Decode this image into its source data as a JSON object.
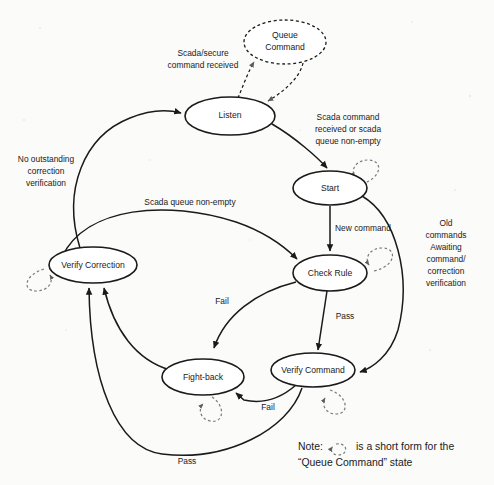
{
  "diagram": {
    "states": [
      {
        "id": "queue-command",
        "label_line1": "Queue",
        "label_line2": "Command",
        "cx": 285,
        "cy": 42,
        "rx": 41,
        "ry": 22,
        "style": "dashed"
      },
      {
        "id": "listen",
        "label_line1": "Listen",
        "label_line2": "",
        "cx": 230,
        "cy": 116,
        "rx": 45,
        "ry": 19,
        "style": "solid"
      },
      {
        "id": "start",
        "label_line1": "Start",
        "label_line2": "",
        "cx": 330,
        "cy": 188,
        "rx": 37,
        "ry": 17,
        "style": "solid"
      },
      {
        "id": "verify-correction",
        "label_line1": "Verify Correction",
        "label_line2": "",
        "cx": 93,
        "cy": 265,
        "rx": 44,
        "ry": 18,
        "style": "solid"
      },
      {
        "id": "check-rule",
        "label_line1": "Check Rule",
        "label_line2": "",
        "cx": 330,
        "cy": 273,
        "rx": 37,
        "ry": 18,
        "style": "solid"
      },
      {
        "id": "fight-back",
        "label_line1": "Fight-back",
        "label_line2": "",
        "cx": 203,
        "cy": 377,
        "rx": 41,
        "ry": 18,
        "style": "solid"
      },
      {
        "id": "verify-command",
        "label_line1": "Verify Command",
        "label_line2": "",
        "cx": 313,
        "cy": 370,
        "rx": 42,
        "ry": 17,
        "style": "solid"
      }
    ],
    "transitions": [
      {
        "id": "listen-to-queue",
        "from": "listen",
        "to": "queue-command",
        "style": "dashed"
      },
      {
        "id": "queue-to-listen",
        "from": "queue-command",
        "to": "listen",
        "style": "dashed"
      },
      {
        "id": "listen-to-start",
        "from": "listen",
        "to": "start",
        "style": "solid"
      },
      {
        "id": "verify-correction-to-listen",
        "from": "verify-correction",
        "to": "listen",
        "style": "solid"
      },
      {
        "id": "start-to-check-rule",
        "from": "start",
        "to": "check-rule",
        "style": "solid"
      },
      {
        "id": "verify-correction-to-check-rule",
        "from": "verify-correction",
        "to": "check-rule",
        "style": "solid"
      },
      {
        "id": "verify-command-to-start-loop",
        "from": "start",
        "to": "verify-command",
        "style": "solid"
      },
      {
        "id": "check-rule-to-fight-back",
        "from": "check-rule",
        "to": "fight-back",
        "style": "solid"
      },
      {
        "id": "check-rule-to-verify-command",
        "from": "check-rule",
        "to": "verify-command",
        "style": "solid"
      },
      {
        "id": "verify-command-to-fight-back",
        "from": "verify-command",
        "to": "fight-back",
        "style": "solid"
      },
      {
        "id": "fight-back-to-verify-correction",
        "from": "fight-back",
        "to": "verify-correction",
        "style": "solid"
      },
      {
        "id": "verify-command-to-verify-correction",
        "from": "verify-command",
        "to": "verify-correction",
        "style": "solid"
      }
    ],
    "self_loops": [
      {
        "id": "start-self-loop",
        "state": "start"
      },
      {
        "id": "check-rule-self-loop",
        "state": "check-rule"
      },
      {
        "id": "verify-correction-self-loop",
        "state": "verify-correction"
      },
      {
        "id": "fight-back-self-loop",
        "state": "fight-back"
      },
      {
        "id": "verify-command-self-loop",
        "state": "verify-command"
      }
    ],
    "edge_labels": [
      {
        "id": "label-scada-secure",
        "lines": [
          "Scada/secure",
          "command received"
        ],
        "x": 203,
        "y": 60
      },
      {
        "id": "label-scada-received",
        "lines": [
          "Scada command",
          "received or scada",
          "queue non-empty"
        ],
        "x": 348,
        "y": 128
      },
      {
        "id": "label-no-outstanding",
        "lines": [
          "No outstanding",
          "correction",
          "verification"
        ],
        "x": 46,
        "y": 170
      },
      {
        "id": "label-scada-queue",
        "lines": [
          "Scada queue non-empty"
        ],
        "x": 190,
        "y": 203
      },
      {
        "id": "label-new-command",
        "lines": [
          "New command"
        ],
        "x": 363,
        "y": 229
      },
      {
        "id": "label-old-commands",
        "lines": [
          "Old",
          "commands",
          "Awaiting",
          "command/",
          "correction",
          "verification"
        ],
        "x": 446,
        "y": 254
      },
      {
        "id": "label-fail-check-rule",
        "lines": [
          "Fail"
        ],
        "x": 222,
        "y": 302
      },
      {
        "id": "label-pass-check-rule",
        "lines": [
          "Pass"
        ],
        "x": 345,
        "y": 317
      },
      {
        "id": "label-fail-verify-command",
        "lines": [
          "Fail"
        ],
        "x": 268,
        "y": 408
      },
      {
        "id": "label-pass-bottom",
        "lines": [
          "Pass"
        ],
        "x": 187,
        "y": 462
      }
    ],
    "note": {
      "line1_prefix": "Note:",
      "line1_suffix": "is a short form for the",
      "line2": "“Queue Command” state",
      "x": 298,
      "y": 447
    },
    "colors": {
      "stroke": "#1a1a1a",
      "dashed_stroke": "#7a7a7a",
      "background": "#fbfbf9",
      "text": "#1a1a1a"
    }
  }
}
